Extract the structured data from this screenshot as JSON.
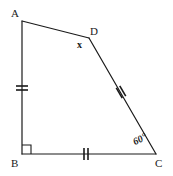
{
  "figure": {
    "type": "quadrilateral",
    "name": "ABCD",
    "background_color": "#ffffff",
    "stroke_color": "#1a1a1a",
    "stroke_width": 1.2
  },
  "vertices": [
    {
      "key": "A",
      "label": "A",
      "x": 22,
      "y": 21,
      "label_x": 11,
      "label_y": 8
    },
    {
      "key": "B",
      "label": "B",
      "x": 22,
      "y": 154,
      "label_x": 11,
      "label_y": 158
    },
    {
      "key": "C",
      "label": "C",
      "x": 156,
      "y": 154,
      "label_x": 155,
      "label_y": 158
    },
    {
      "key": "D",
      "label": "D",
      "x": 89,
      "y": 38,
      "label_x": 90,
      "label_y": 26
    }
  ],
  "sides": [
    {
      "key": "AD",
      "from": "A",
      "to": "D",
      "ticks": 0
    },
    {
      "key": "AB",
      "from": "A",
      "to": "B",
      "ticks": 2
    },
    {
      "key": "BC",
      "from": "B",
      "to": "C",
      "ticks": 2
    },
    {
      "key": "DC",
      "from": "D",
      "to": "C",
      "ticks": 2
    }
  ],
  "tick_marks": [
    {
      "key": "tick-AB",
      "side": "AB",
      "cx": 22,
      "cy": 88,
      "orientation": "horizontal"
    },
    {
      "key": "tick-BC",
      "side": "BC",
      "cx": 86,
      "cy": 154,
      "orientation": "vertical"
    },
    {
      "key": "tick-DC",
      "side": "DC",
      "cx": 121,
      "cy": 92,
      "orientation": "perpendicular"
    }
  ],
  "angles": [
    {
      "key": "angle-B",
      "vertex": "B",
      "marker": "right-angle-square",
      "value": "90",
      "label": ""
    },
    {
      "key": "angle-D",
      "vertex": "D",
      "marker": "none",
      "label": "x",
      "label_x": 77,
      "label_y": 40
    },
    {
      "key": "angle-C",
      "vertex": "C",
      "marker": "none",
      "label": "60°",
      "label_x": 136,
      "label_y": 146
    }
  ],
  "right_angle_marker": {
    "key": "right-angle-B",
    "x": 22,
    "y": 154,
    "size": 9
  },
  "labels": {
    "vertex_a": "A",
    "vertex_b": "B",
    "vertex_c": "C",
    "vertex_d": "D",
    "angle_d": "x",
    "angle_c": "60°"
  }
}
